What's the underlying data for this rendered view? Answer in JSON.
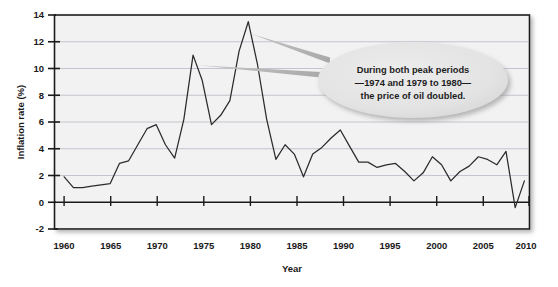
{
  "chart_data": {
    "type": "line",
    "title": "",
    "xlabel": "Year",
    "ylabel": "Inflation rate (%)",
    "xlim": [
      1959,
      2010.5
    ],
    "ylim": [
      -2,
      14
    ],
    "grid": true,
    "legend_position": "none",
    "xticks": [
      1960,
      1965,
      1970,
      1975,
      1980,
      1985,
      1990,
      1995,
      2000,
      2005,
      2010
    ],
    "xtick_labels": [
      "1960",
      "1965",
      "1970",
      "1975",
      "1980",
      "1985",
      "1990",
      "1995",
      "2000",
      "2005",
      "2010"
    ],
    "yticks": [
      -2,
      0,
      2,
      4,
      6,
      8,
      10,
      12,
      14
    ],
    "ytick_labels": [
      "-2",
      "0",
      "2",
      "4",
      "6",
      "8",
      "10",
      "12",
      "14"
    ],
    "series": [
      {
        "name": "Inflation rate",
        "color": "#2b2b2b",
        "x": [
          1960,
          1961,
          1962,
          1963,
          1964,
          1965,
          1966,
          1967,
          1968,
          1969,
          1970,
          1971,
          1972,
          1973,
          1974,
          1975,
          1976,
          1977,
          1978,
          1979,
          1980,
          1981,
          1982,
          1983,
          1984,
          1985,
          1986,
          1987,
          1988,
          1989,
          1990,
          1991,
          1992,
          1993,
          1994,
          1995,
          1996,
          1997,
          1998,
          1999,
          2000,
          2001,
          2002,
          2003,
          2004,
          2005,
          2006,
          2007,
          2008,
          2009,
          2010
        ],
        "values": [
          1.9,
          1.1,
          1.1,
          1.2,
          1.3,
          1.4,
          2.9,
          3.1,
          4.3,
          5.5,
          5.8,
          4.3,
          3.3,
          6.2,
          11.0,
          9.1,
          5.8,
          6.5,
          7.6,
          11.3,
          13.5,
          10.3,
          6.2,
          3.2,
          4.3,
          3.6,
          1.9,
          3.6,
          4.1,
          4.8,
          5.4,
          4.2,
          3.0,
          3.0,
          2.6,
          2.8,
          2.9,
          2.3,
          1.6,
          2.2,
          3.4,
          2.8,
          1.6,
          2.3,
          2.7,
          3.4,
          3.2,
          2.8,
          3.8,
          -0.4,
          1.6
        ]
      }
    ],
    "annotations": [
      {
        "name": "peak-callout",
        "lines": [
          "During both peak periods",
          "—1974 and 1979 to 1980—",
          "the price of oil doubled."
        ],
        "pointer_targets": [
          1974,
          1980
        ],
        "shape": "ellipse",
        "fill_color": "#e2e2e2"
      }
    ],
    "colors": {
      "plot_background": "#f2f2f2",
      "gridline": "#b8b8c4",
      "axis_frame": "#1a1a1a",
      "zero_line": "#1a1a1a",
      "line": "#2b2b2b",
      "callout_fill": "#e2e2e2",
      "callout_pointer": "#b5b5b5",
      "text": "#1a1a1a"
    }
  }
}
